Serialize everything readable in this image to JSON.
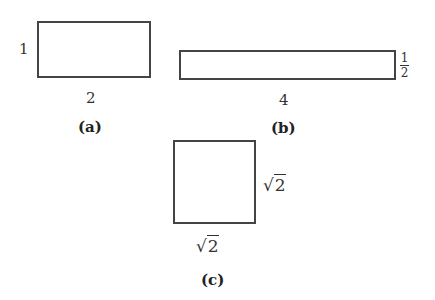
{
  "figures": [
    {
      "id": "a",
      "caption": "(a)",
      "width_label": "2",
      "height_label": "1"
    },
    {
      "id": "b",
      "caption": "(b)",
      "width_label": "4",
      "height_label": {
        "numerator": "1",
        "denominator": "2"
      }
    },
    {
      "id": "c",
      "caption": "(c)",
      "width_label": {
        "radical": "√",
        "radicand": "2"
      },
      "height_label": {
        "radical": "√",
        "radicand": "2"
      }
    }
  ]
}
